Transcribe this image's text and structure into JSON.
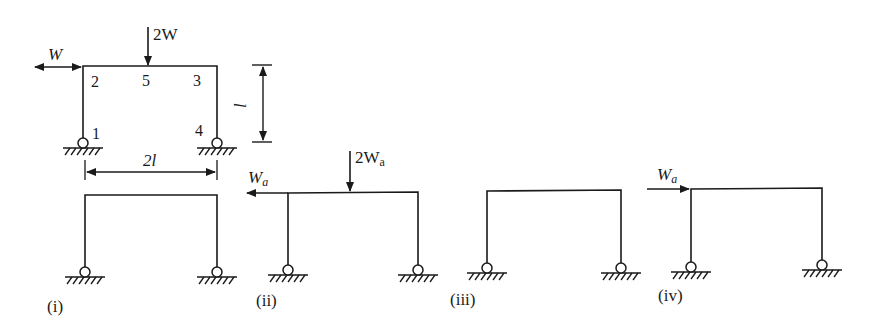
{
  "colors": {
    "ink": "#1a1a1a",
    "background": "#ffffff"
  },
  "main_frame": {
    "nodes": [
      "1",
      "2",
      "3",
      "4",
      "5"
    ],
    "load_horizontal": "W",
    "load_vertical": "2W",
    "height_dim": "l",
    "span_dim": "2l"
  },
  "cases": [
    {
      "label": "(i)"
    },
    {
      "label": "(ii)",
      "load_horizontal_main": "W",
      "load_horizontal_sub": "a",
      "load_vertical_main": "2W",
      "load_vertical_sub": "a"
    },
    {
      "label": "(iii)"
    },
    {
      "label": "(iv)",
      "load_horizontal_main": "W",
      "load_horizontal_sub": "a"
    }
  ]
}
